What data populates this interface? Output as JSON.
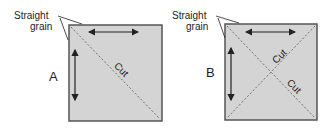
{
  "panels": [
    {
      "id": "A",
      "label": "A",
      "annotation": [
        "Straight",
        "grain"
      ],
      "cuts": [
        "Cut"
      ]
    },
    {
      "id": "B",
      "label": "B",
      "annotation": [
        "Straight",
        "grain"
      ],
      "cuts": [
        "Cut",
        "Cut"
      ]
    }
  ],
  "colors": {
    "fabric": "#d4d4d4",
    "border": "#555555",
    "ink": "#222222"
  }
}
